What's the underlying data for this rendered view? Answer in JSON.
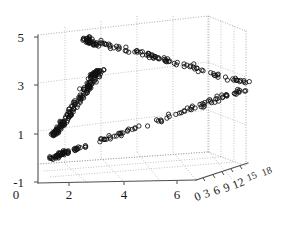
{
  "figure": {
    "background_color": "#ffffff",
    "axis_color": "#4d4d4d",
    "grid_color": "#9a9a9a",
    "marker_color": "#101010"
  },
  "chart_data": {
    "type": "scatter",
    "title": "",
    "xlabel": "",
    "ylabel": "",
    "zlabel": "",
    "projection": "3d",
    "grid": true,
    "legend": null,
    "marker": "open-circle",
    "marker_size": 4,
    "xlim": [
      0,
      7
    ],
    "ylim": [
      -1,
      5
    ],
    "zlim": [
      0,
      19.5
    ],
    "xticks": [
      0,
      2,
      4,
      6
    ],
    "yticks": [
      -1,
      1,
      3,
      5
    ],
    "zticks": [
      0,
      3,
      6,
      9,
      12,
      15,
      18
    ],
    "xtick_labels": [
      "0",
      "2",
      "4",
      "6"
    ],
    "ytick_labels": [
      "-1",
      "1",
      "3",
      "5"
    ],
    "ztick_labels": [
      "0",
      "3",
      "6",
      "9",
      "12",
      "15",
      "18"
    ],
    "clusters": [
      {
        "name": "upper-branch",
        "n": 95,
        "x_range": [
          1.6,
          5.1
        ],
        "y_range": [
          2.6,
          4.9
        ],
        "z_range": [
          0.5,
          10.0
        ]
      },
      {
        "name": "middle-branch",
        "n": 120,
        "x_range": [
          0.3,
          1.6
        ],
        "y_range": [
          0.8,
          3.4
        ],
        "z_range": [
          0.2,
          4.5
        ]
      },
      {
        "name": "lower-branch",
        "n": 105,
        "x_range": [
          0.3,
          5.0
        ],
        "y_range": [
          -0.2,
          2.4
        ],
        "z_range": [
          0.2,
          10.0
        ]
      }
    ]
  },
  "ticks": {
    "y": [
      {
        "label": "5",
        "x": 14,
        "y": 31
      },
      {
        "label": "3",
        "x": 14,
        "y": 79
      },
      {
        "label": "1",
        "x": 14,
        "y": 128
      },
      {
        "label": "-1",
        "x": 8,
        "y": 176
      }
    ],
    "x": [
      {
        "label": "0",
        "x": 16,
        "y": 188
      },
      {
        "label": "2",
        "x": 69,
        "y": 188
      },
      {
        "label": "4",
        "x": 124,
        "y": 188
      },
      {
        "label": "6",
        "x": 177,
        "y": 188
      }
    ],
    "z": [
      {
        "label": "0",
        "x": 196,
        "y": 196,
        "rot": -23
      },
      {
        "label": "3",
        "x": 206,
        "y": 193,
        "rot": -23
      },
      {
        "label": "6",
        "x": 216,
        "y": 190,
        "rot": -23
      },
      {
        "label": "9",
        "x": 226,
        "y": 187,
        "rot": -23
      },
      {
        "label": "12",
        "x": 235,
        "y": 184,
        "rot": -23
      },
      {
        "label": "15",
        "x": 249,
        "y": 179,
        "rot": -23
      },
      {
        "label": "18",
        "x": 264,
        "y": 174,
        "rot": -23
      }
    ]
  }
}
